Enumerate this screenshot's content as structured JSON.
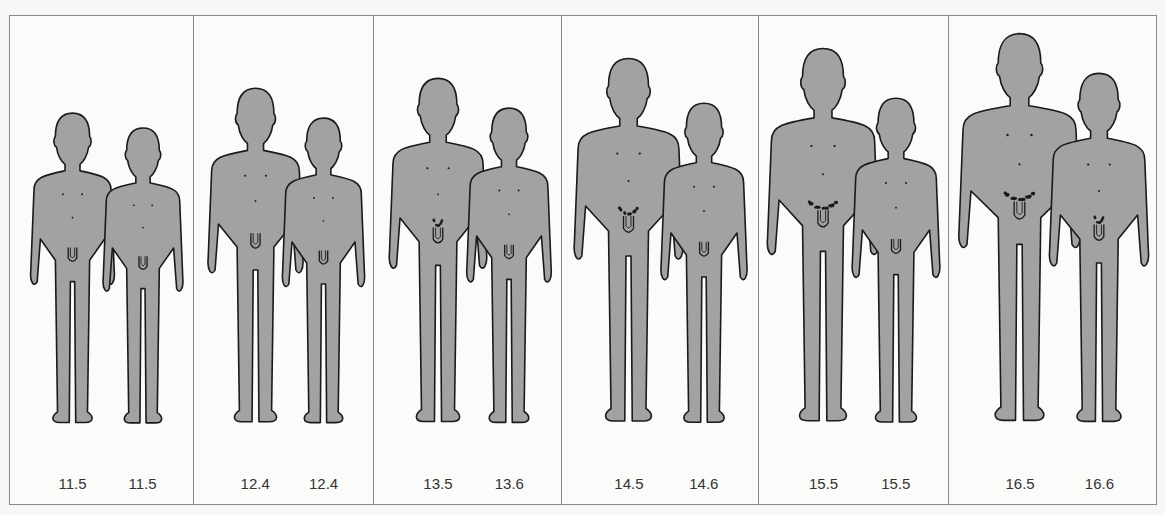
{
  "diagram": {
    "type": "growth-stage-comparison",
    "fill_color": "#a2a2a2",
    "outline_color": "#1a1a1a",
    "panels": [
      {
        "id": 1,
        "figures": [
          {
            "age": "11.5",
            "height": 320,
            "stage": 1,
            "hair": 0
          },
          {
            "age": "11.5",
            "height": 305,
            "stage": 1,
            "hair": 0
          }
        ]
      },
      {
        "id": 2,
        "figures": [
          {
            "age": "12.4",
            "height": 345,
            "stage": 2,
            "hair": 0
          },
          {
            "age": "12.4",
            "height": 315,
            "stage": 1,
            "hair": 0
          }
        ]
      },
      {
        "id": 3,
        "figures": [
          {
            "age": "13.5",
            "height": 355,
            "stage": 2,
            "hair": 1
          },
          {
            "age": "13.6",
            "height": 325,
            "stage": 1,
            "hair": 0
          }
        ]
      },
      {
        "id": 4,
        "figures": [
          {
            "age": "14.5",
            "height": 375,
            "stage": 3,
            "hair": 2
          },
          {
            "age": "14.6",
            "height": 330,
            "stage": 1,
            "hair": 0
          }
        ]
      },
      {
        "id": 5,
        "figures": [
          {
            "age": "15.5",
            "height": 385,
            "stage": 3,
            "hair": 3
          },
          {
            "age": "15.5",
            "height": 335,
            "stage": 1,
            "hair": 0
          }
        ]
      },
      {
        "id": 6,
        "figures": [
          {
            "age": "16.5",
            "height": 400,
            "stage": 4,
            "hair": 3
          },
          {
            "age": "16.6",
            "height": 360,
            "stage": 2,
            "hair": 1
          }
        ]
      }
    ]
  },
  "layout": {
    "panel_bounds": [
      [
        0,
        184
      ],
      [
        184,
        364
      ],
      [
        364,
        552
      ],
      [
        552,
        749
      ],
      [
        749,
        939
      ],
      [
        939,
        1148
      ]
    ]
  }
}
